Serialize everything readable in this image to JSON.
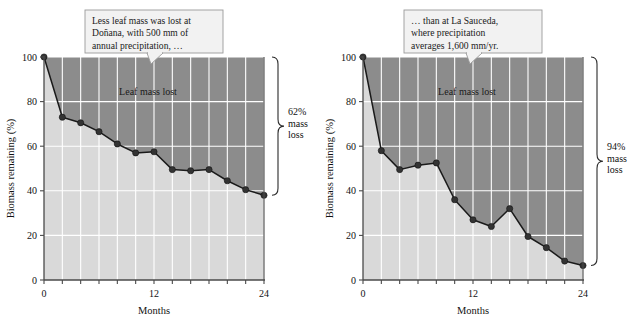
{
  "figure": {
    "panels": [
      {
        "id": "donana",
        "callout": {
          "lines": [
            "Less leaf mass was lost at",
            "Doñana, with 500 mm of",
            "annual precipitation, …"
          ]
        },
        "inner_label": "Leaf mass lost",
        "brace": {
          "lines": [
            "62%",
            "mass",
            "loss"
          ]
        },
        "chart_data": {
          "type": "line",
          "title": "",
          "xlabel": "Months",
          "ylabel": "Biomass remaining (%)",
          "xlim": [
            0,
            24
          ],
          "ylim": [
            0,
            100
          ],
          "xticks": [
            0,
            12,
            24
          ],
          "xtick_labels": [
            "0",
            "12",
            "24"
          ],
          "xminor_step": 2,
          "yticks": [
            0,
            20,
            40,
            60,
            80,
            100
          ],
          "ytick_labels": [
            "0",
            "20",
            "40",
            "60",
            "80",
            "100"
          ],
          "grid": true,
          "legend": "none",
          "x": [
            0,
            2,
            4,
            6,
            8,
            10,
            12,
            14,
            16,
            18,
            20,
            22,
            24
          ],
          "values": [
            100,
            73,
            70.5,
            66.5,
            61,
            57,
            57.5,
            49.5,
            49,
            49.5,
            44.5,
            40.5,
            38
          ],
          "series_name": "Biomass remaining",
          "fill_below_label": "Biomass remaining",
          "fill_above_label": "Leaf mass lost"
        }
      },
      {
        "id": "la-sauceda",
        "callout": {
          "lines": [
            "… than at La Sauceda,",
            "where precipitation",
            "averages 1,600 mm/yr."
          ]
        },
        "inner_label": "Leaf mass lost",
        "brace": {
          "lines": [
            "94%",
            "mass",
            "loss"
          ]
        },
        "chart_data": {
          "type": "line",
          "title": "",
          "xlabel": "Months",
          "ylabel": "Biomass remaining (%)",
          "xlim": [
            0,
            24
          ],
          "ylim": [
            0,
            100
          ],
          "xticks": [
            0,
            12,
            24
          ],
          "xtick_labels": [
            "0",
            "12",
            "24"
          ],
          "xminor_step": 2,
          "yticks": [
            0,
            20,
            40,
            60,
            80,
            100
          ],
          "ytick_labels": [
            "0",
            "20",
            "40",
            "60",
            "80",
            "100"
          ],
          "grid": true,
          "legend": "none",
          "x": [
            0,
            2,
            4,
            6,
            8,
            10,
            12,
            14,
            16,
            18,
            20,
            22,
            24
          ],
          "values": [
            100,
            58,
            49.5,
            51.5,
            52.5,
            36,
            27,
            24,
            32,
            19.5,
            14.5,
            8.5,
            6.5
          ],
          "series_name": "Biomass remaining",
          "fill_below_label": "Biomass remaining",
          "fill_above_label": "Leaf mass lost"
        }
      }
    ]
  },
  "colors": {
    "background": "#ffffff",
    "area_below": "#d9d9d9",
    "area_above": "#8c8c8c",
    "gridline": "#ffffff",
    "line": "#1a1a1a",
    "marker": "#333333",
    "axis": "#555555",
    "callout_fill": "#f2f2f2",
    "callout_border": "#9a9a9a",
    "text": "#111111"
  }
}
